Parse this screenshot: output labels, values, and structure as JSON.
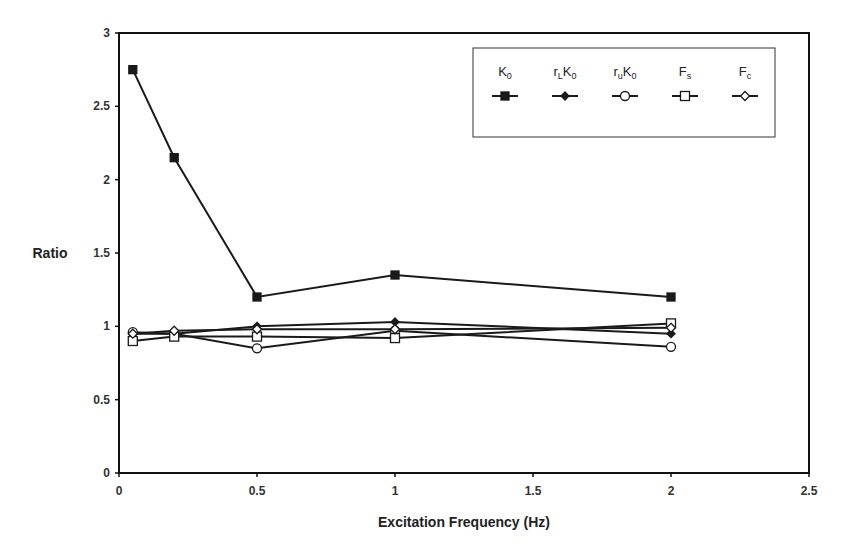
{
  "chart_data": {
    "type": "line",
    "title": "",
    "xlabel": "Excitation Frequency (Hz)",
    "ylabel": "Ratio",
    "xlim": [
      0,
      2.5
    ],
    "ylim": [
      0,
      3
    ],
    "x_ticks": [
      "0",
      "0.5",
      "1",
      "1.5",
      "2",
      "2.5"
    ],
    "y_ticks": [
      "0",
      "0.5",
      "1",
      "1.5",
      "2",
      "2.5",
      "3"
    ],
    "grid": false,
    "legend_position": "top-right (inside, boxed)",
    "x": [
      0.05,
      0.2,
      0.5,
      1,
      2
    ],
    "series": [
      {
        "name": "K0",
        "label_main": "K",
        "label_sub": "0",
        "label_prefix": "",
        "label_prefix_sub": "",
        "marker": "filled-square",
        "values": [
          2.75,
          2.15,
          1.2,
          1.35,
          1.2
        ]
      },
      {
        "name": "rLK0",
        "label_main": "K",
        "label_sub": "0",
        "label_prefix": "r",
        "label_prefix_sub": "L",
        "marker": "filled-diamond",
        "values": [
          0.95,
          0.95,
          1.0,
          1.03,
          0.95
        ]
      },
      {
        "name": "ruK0",
        "label_main": "K",
        "label_sub": "0",
        "label_prefix": "r",
        "label_prefix_sub": "u",
        "marker": "open-circle",
        "values": [
          0.96,
          0.95,
          0.85,
          0.97,
          0.86
        ]
      },
      {
        "name": "Fs",
        "label_main": "F",
        "label_sub": "s",
        "label_prefix": "",
        "label_prefix_sub": "",
        "marker": "open-square",
        "values": [
          0.9,
          0.93,
          0.93,
          0.92,
          1.02
        ]
      },
      {
        "name": "Fc",
        "label_main": "F",
        "label_sub": "c",
        "label_prefix": "",
        "label_prefix_sub": "",
        "marker": "open-diamond",
        "values": [
          0.95,
          0.97,
          0.98,
          0.98,
          0.99
        ]
      }
    ],
    "colors": {
      "line": "#1a1a1a",
      "axis": "#111111",
      "background": "#ffffff"
    }
  }
}
